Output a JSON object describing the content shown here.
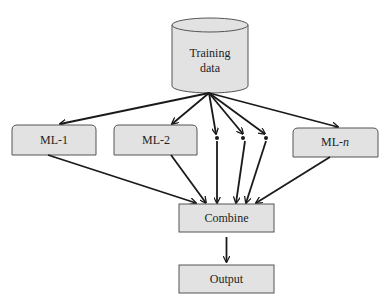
{
  "source": {
    "line1": "Training",
    "line2": "data"
  },
  "models": [
    {
      "label": "ML-1"
    },
    {
      "label": "ML-2"
    },
    {
      "label_prefix": "ML-",
      "label_italic": "n"
    }
  ],
  "ellipsis_dots": 3,
  "combine": {
    "label": "Combine"
  },
  "output": {
    "label": "Output"
  },
  "colors": {
    "box_fill": "#e2e2e2",
    "stroke": "#555555",
    "arrow": "#1a1a1a"
  }
}
